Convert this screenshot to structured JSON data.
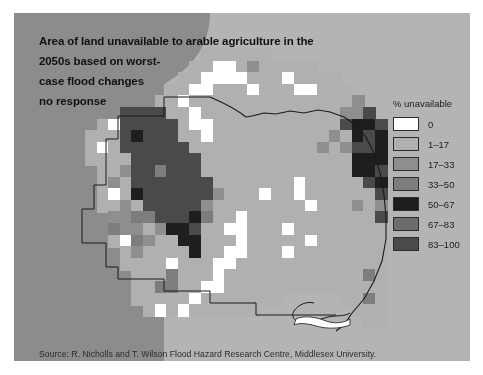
{
  "panel": {
    "background_color": "#8c8c8c",
    "sea_color": "#b4b4b4"
  },
  "title": {
    "lines": [
      "Area of land unavailable to arable agriculture in the",
      "2050s based on worst-",
      "case flood changes",
      "no response"
    ]
  },
  "source": {
    "text": "Source: R. Nicholls and T. Wilson Flood Hazard Research Centre, Middlesex University."
  },
  "legend": {
    "title": "% unavailable",
    "items": [
      {
        "label": "0",
        "color": "#ffffff"
      },
      {
        "label": "1–17",
        "color": "#b0b0b0"
      },
      {
        "label": "17–33",
        "color": "#8e8e8e"
      },
      {
        "label": "33–50",
        "color": "#7d7d7d"
      },
      {
        "label": "50–67",
        "color": "#1e1e1e"
      },
      {
        "label": "67–83",
        "color": "#6d6d6d"
      },
      {
        "label": "83–100",
        "color": "#4a4a4a"
      }
    ]
  },
  "chart_data": {
    "type": "heatmap",
    "region": "East Anglia, United Kingdom",
    "value_unit": "% unavailable",
    "legend_breaks": [
      0,
      1,
      17,
      33,
      50,
      67,
      83,
      100
    ],
    "class_colors": [
      "#ffffff",
      "#b0b0b0",
      "#8e8e8e",
      "#7d7d7d",
      "#1e1e1e",
      "#6d6d6d",
      "#4a4a4a"
    ],
    "grid": {
      "cell_px": 11.6,
      "origin_x": 85,
      "origin_y": 49,
      "cols": 27,
      "rows": 24,
      "note": "class index per cell; -1 = outside study area (sea / background)"
    },
    "cells": [
      [
        -1,
        -1,
        -1,
        -1,
        -1,
        -1,
        -1,
        -1,
        -1,
        -1,
        1,
        1,
        1,
        1,
        1,
        1,
        -1,
        -1,
        -1,
        -1,
        -1,
        -1,
        -1,
        -1,
        -1,
        -1,
        -1
      ],
      [
        -1,
        -1,
        -1,
        -1,
        -1,
        -1,
        -1,
        -1,
        -1,
        1,
        1,
        0,
        0,
        1,
        2,
        1,
        1,
        1,
        1,
        1,
        -1,
        -1,
        -1,
        -1,
        -1,
        -1,
        -1
      ],
      [
        -1,
        -1,
        -1,
        -1,
        -1,
        -1,
        -1,
        -1,
        1,
        1,
        0,
        0,
        0,
        0,
        1,
        1,
        1,
        0,
        1,
        1,
        1,
        1,
        -1,
        -1,
        -1,
        -1,
        -1
      ],
      [
        -1,
        -1,
        -1,
        -1,
        -1,
        -1,
        -1,
        1,
        1,
        0,
        0,
        1,
        1,
        1,
        0,
        1,
        1,
        1,
        0,
        0,
        1,
        1,
        1,
        -1,
        -1,
        -1,
        -1
      ],
      [
        -1,
        -1,
        -1,
        -1,
        -1,
        -1,
        1,
        1,
        0,
        1,
        1,
        1,
        1,
        1,
        1,
        1,
        1,
        1,
        1,
        1,
        1,
        1,
        1,
        2,
        -1,
        -1,
        -1
      ],
      [
        -1,
        -1,
        -1,
        6,
        6,
        6,
        6,
        1,
        1,
        0,
        1,
        1,
        1,
        1,
        1,
        1,
        1,
        1,
        1,
        1,
        1,
        1,
        2,
        2,
        6,
        -1,
        -1
      ],
      [
        -1,
        1,
        0,
        6,
        6,
        6,
        6,
        6,
        1,
        0,
        0,
        1,
        1,
        1,
        1,
        1,
        1,
        1,
        1,
        1,
        1,
        1,
        6,
        4,
        4,
        6,
        -1
      ],
      [
        1,
        1,
        1,
        6,
        4,
        6,
        6,
        6,
        1,
        1,
        0,
        1,
        1,
        1,
        1,
        1,
        1,
        1,
        1,
        1,
        1,
        2,
        1,
        4,
        6,
        4,
        -1
      ],
      [
        1,
        0,
        1,
        6,
        6,
        6,
        6,
        6,
        6,
        1,
        1,
        1,
        1,
        1,
        1,
        1,
        1,
        1,
        1,
        1,
        2,
        1,
        2,
        6,
        6,
        4,
        -1
      ],
      [
        1,
        1,
        1,
        1,
        6,
        6,
        6,
        6,
        6,
        6,
        1,
        1,
        1,
        1,
        1,
        1,
        1,
        1,
        1,
        1,
        1,
        1,
        1,
        4,
        4,
        4,
        -1
      ],
      [
        -1,
        1,
        1,
        2,
        6,
        6,
        3,
        6,
        6,
        6,
        1,
        1,
        1,
        1,
        1,
        1,
        1,
        1,
        1,
        1,
        1,
        1,
        1,
        4,
        4,
        6,
        -1
      ],
      [
        -1,
        1,
        2,
        1,
        6,
        6,
        6,
        6,
        6,
        6,
        6,
        1,
        1,
        1,
        1,
        1,
        1,
        1,
        0,
        1,
        1,
        1,
        1,
        1,
        6,
        4,
        -1
      ],
      [
        -1,
        1,
        0,
        1,
        4,
        6,
        6,
        6,
        6,
        6,
        6,
        2,
        1,
        1,
        1,
        0,
        1,
        1,
        0,
        1,
        1,
        1,
        1,
        1,
        1,
        6,
        -1
      ],
      [
        -1,
        1,
        1,
        2,
        1,
        6,
        6,
        6,
        6,
        6,
        2,
        1,
        1,
        1,
        1,
        1,
        1,
        1,
        1,
        0,
        1,
        1,
        1,
        2,
        1,
        2,
        -1
      ],
      [
        -1,
        -1,
        2,
        2,
        3,
        3,
        6,
        6,
        6,
        4,
        3,
        1,
        1,
        0,
        1,
        1,
        1,
        1,
        1,
        1,
        1,
        1,
        1,
        1,
        1,
        6,
        -1
      ],
      [
        -1,
        -1,
        3,
        2,
        2,
        1,
        2,
        4,
        4,
        6,
        1,
        1,
        0,
        0,
        1,
        1,
        1,
        0,
        1,
        1,
        1,
        1,
        1,
        1,
        1,
        1,
        -1
      ],
      [
        -1,
        -1,
        1,
        0,
        3,
        2,
        1,
        1,
        4,
        4,
        1,
        1,
        1,
        0,
        1,
        1,
        1,
        1,
        1,
        0,
        1,
        1,
        1,
        1,
        1,
        1,
        -1
      ],
      [
        -1,
        -1,
        -1,
        1,
        2,
        1,
        1,
        1,
        1,
        4,
        1,
        1,
        0,
        0,
        1,
        1,
        1,
        0,
        1,
        1,
        1,
        1,
        1,
        1,
        1,
        1,
        -1
      ],
      [
        -1,
        -1,
        -1,
        1,
        1,
        1,
        1,
        0,
        1,
        1,
        1,
        0,
        0,
        1,
        1,
        1,
        1,
        1,
        1,
        1,
        1,
        1,
        1,
        1,
        1,
        1,
        -1
      ],
      [
        -1,
        -1,
        -1,
        -1,
        1,
        1,
        1,
        3,
        1,
        1,
        1,
        0,
        1,
        1,
        1,
        1,
        1,
        1,
        1,
        1,
        1,
        1,
        1,
        1,
        3,
        1,
        -1
      ],
      [
        -1,
        -1,
        -1,
        -1,
        1,
        1,
        3,
        3,
        1,
        1,
        0,
        0,
        1,
        1,
        1,
        1,
        1,
        1,
        1,
        1,
        1,
        1,
        1,
        1,
        1,
        1,
        -1
      ],
      [
        -1,
        -1,
        -1,
        -1,
        1,
        1,
        1,
        1,
        1,
        0,
        1,
        1,
        1,
        1,
        1,
        1,
        1,
        -1,
        -1,
        -1,
        -1,
        -1,
        1,
        1,
        3,
        1,
        -1
      ],
      [
        -1,
        -1,
        -1,
        -1,
        -1,
        1,
        0,
        1,
        0,
        1,
        1,
        1,
        1,
        1,
        1,
        -1,
        -1,
        -1,
        -1,
        -1,
        -1,
        -1,
        -1,
        1,
        1,
        1,
        -1
      ],
      [
        -1,
        -1,
        -1,
        -1,
        -1,
        -1,
        -1,
        -1,
        -1,
        -1,
        -1,
        -1,
        -1,
        -1,
        -1,
        -1,
        -1,
        -1,
        -1,
        -1,
        -1,
        -1,
        -1,
        -1,
        1,
        1,
        -1
      ]
    ]
  }
}
